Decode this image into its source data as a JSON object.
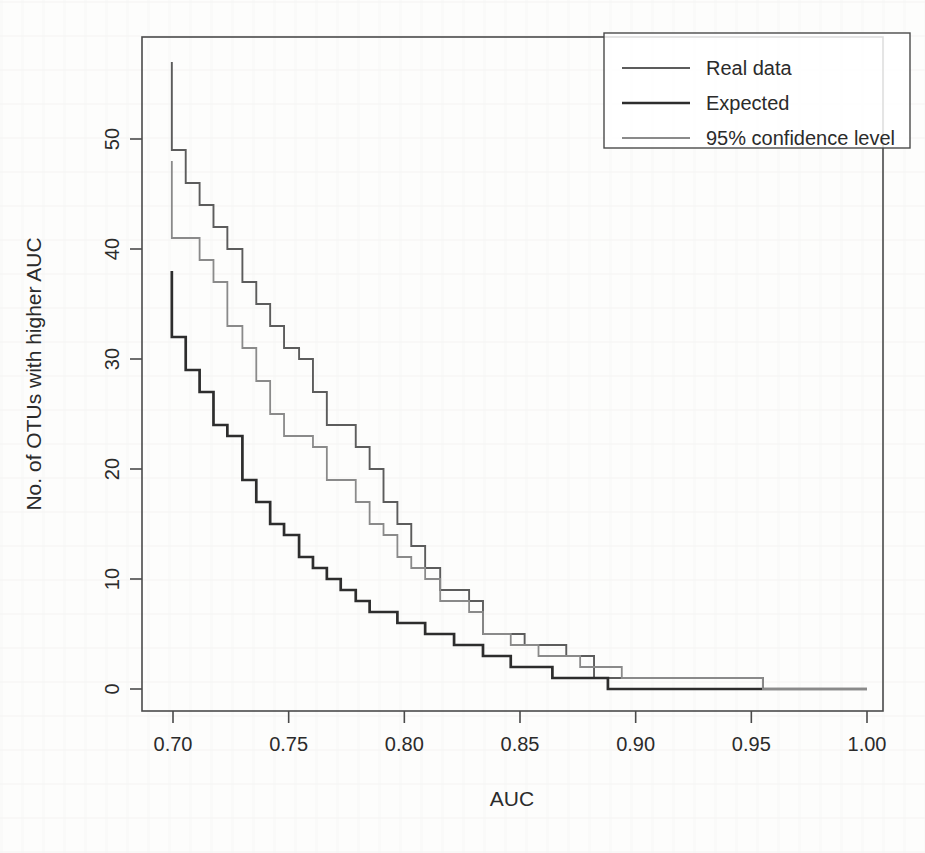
{
  "figure": {
    "background_color": "#fdfdfc",
    "frame_color": "#4a4a4a",
    "text_color": "#2b2b2b"
  },
  "chart_data": {
    "type": "line",
    "subtype": "step",
    "title": "",
    "xlabel": "AUC",
    "ylabel": "No. of OTUs with higher AUC",
    "xlim": [
      0.6855,
      1.0125
    ],
    "ylim": [
      -1.6,
      59.5
    ],
    "xticks": [
      0.7,
      0.75,
      0.8,
      0.85,
      0.9,
      0.95,
      1.0
    ],
    "xtick_labels": [
      "0.70",
      "0.75",
      "0.80",
      "0.85",
      "0.90",
      "0.95",
      "1.00"
    ],
    "yticks": [
      0,
      10,
      20,
      30,
      40,
      50
    ],
    "ytick_labels": [
      "0",
      "10",
      "20",
      "30",
      "40",
      "50"
    ],
    "grid": false,
    "legend_position": "top-right",
    "series": [
      {
        "name": "Real data",
        "color": "#5c5c5c",
        "width": 1.9,
        "points": [
          [
            0.6995,
            57
          ],
          [
            0.6995,
            49
          ],
          [
            0.7055,
            49
          ],
          [
            0.7055,
            46
          ],
          [
            0.7115,
            46
          ],
          [
            0.7115,
            44
          ],
          [
            0.7175,
            44
          ],
          [
            0.7175,
            42
          ],
          [
            0.7235,
            42
          ],
          [
            0.7235,
            40
          ],
          [
            0.73,
            40
          ],
          [
            0.73,
            37
          ],
          [
            0.736,
            37
          ],
          [
            0.736,
            35
          ],
          [
            0.742,
            35
          ],
          [
            0.742,
            33
          ],
          [
            0.748,
            33
          ],
          [
            0.748,
            31
          ],
          [
            0.7545,
            31
          ],
          [
            0.7545,
            30
          ],
          [
            0.7605,
            30
          ],
          [
            0.7605,
            27
          ],
          [
            0.7665,
            27
          ],
          [
            0.7665,
            24
          ],
          [
            0.779,
            24
          ],
          [
            0.779,
            22
          ],
          [
            0.785,
            22
          ],
          [
            0.785,
            20
          ],
          [
            0.791,
            20
          ],
          [
            0.791,
            17
          ],
          [
            0.797,
            17
          ],
          [
            0.797,
            15
          ],
          [
            0.803,
            15
          ],
          [
            0.803,
            13
          ],
          [
            0.809,
            13
          ],
          [
            0.809,
            11
          ],
          [
            0.8155,
            11
          ],
          [
            0.8155,
            9
          ],
          [
            0.828,
            9
          ],
          [
            0.828,
            8
          ],
          [
            0.834,
            8
          ],
          [
            0.834,
            5
          ],
          [
            0.852,
            5
          ],
          [
            0.852,
            4
          ],
          [
            0.87,
            4
          ],
          [
            0.87,
            3
          ],
          [
            0.882,
            3
          ],
          [
            0.882,
            1
          ],
          [
            0.955,
            1
          ],
          [
            0.955,
            0
          ],
          [
            1.0,
            0
          ]
        ]
      },
      {
        "name": "Expected",
        "color": "#2d2d2d",
        "width": 2.7,
        "points": [
          [
            0.6995,
            38
          ],
          [
            0.6995,
            32
          ],
          [
            0.7055,
            32
          ],
          [
            0.7055,
            29
          ],
          [
            0.7115,
            29
          ],
          [
            0.7115,
            27
          ],
          [
            0.7175,
            27
          ],
          [
            0.7175,
            24
          ],
          [
            0.7235,
            24
          ],
          [
            0.7235,
            23
          ],
          [
            0.73,
            23
          ],
          [
            0.73,
            19
          ],
          [
            0.736,
            19
          ],
          [
            0.736,
            17
          ],
          [
            0.742,
            17
          ],
          [
            0.742,
            15
          ],
          [
            0.748,
            15
          ],
          [
            0.748,
            14
          ],
          [
            0.7545,
            14
          ],
          [
            0.7545,
            12
          ],
          [
            0.7605,
            12
          ],
          [
            0.7605,
            11
          ],
          [
            0.7665,
            11
          ],
          [
            0.7665,
            10
          ],
          [
            0.7725,
            10
          ],
          [
            0.7725,
            9
          ],
          [
            0.779,
            9
          ],
          [
            0.779,
            8
          ],
          [
            0.785,
            8
          ],
          [
            0.785,
            7
          ],
          [
            0.797,
            7
          ],
          [
            0.797,
            6
          ],
          [
            0.809,
            6
          ],
          [
            0.809,
            5
          ],
          [
            0.8215,
            5
          ],
          [
            0.8215,
            4
          ],
          [
            0.834,
            4
          ],
          [
            0.834,
            3
          ],
          [
            0.846,
            3
          ],
          [
            0.846,
            2
          ],
          [
            0.864,
            2
          ],
          [
            0.864,
            1
          ],
          [
            0.888,
            1
          ],
          [
            0.888,
            0
          ],
          [
            1.0,
            0
          ]
        ]
      },
      {
        "name": "95% confidence level",
        "color": "#8a8a8a",
        "width": 1.8,
        "points": [
          [
            0.6995,
            48
          ],
          [
            0.6995,
            41
          ],
          [
            0.7115,
            41
          ],
          [
            0.7115,
            39
          ],
          [
            0.7175,
            39
          ],
          [
            0.7175,
            37
          ],
          [
            0.7235,
            37
          ],
          [
            0.7235,
            33
          ],
          [
            0.73,
            33
          ],
          [
            0.73,
            31
          ],
          [
            0.736,
            31
          ],
          [
            0.736,
            28
          ],
          [
            0.742,
            28
          ],
          [
            0.742,
            25
          ],
          [
            0.748,
            25
          ],
          [
            0.748,
            23
          ],
          [
            0.7605,
            23
          ],
          [
            0.7605,
            22
          ],
          [
            0.7665,
            22
          ],
          [
            0.7665,
            19
          ],
          [
            0.779,
            19
          ],
          [
            0.779,
            17
          ],
          [
            0.785,
            17
          ],
          [
            0.785,
            15
          ],
          [
            0.791,
            15
          ],
          [
            0.791,
            14
          ],
          [
            0.797,
            14
          ],
          [
            0.797,
            12
          ],
          [
            0.803,
            12
          ],
          [
            0.803,
            11
          ],
          [
            0.809,
            11
          ],
          [
            0.809,
            10
          ],
          [
            0.8155,
            10
          ],
          [
            0.8155,
            8
          ],
          [
            0.828,
            8
          ],
          [
            0.828,
            7
          ],
          [
            0.834,
            7
          ],
          [
            0.834,
            5
          ],
          [
            0.846,
            5
          ],
          [
            0.846,
            4
          ],
          [
            0.858,
            4
          ],
          [
            0.858,
            3
          ],
          [
            0.876,
            3
          ],
          [
            0.876,
            2
          ],
          [
            0.894,
            2
          ],
          [
            0.894,
            1
          ],
          [
            0.955,
            1
          ],
          [
            0.955,
            0
          ],
          [
            1.0,
            0
          ]
        ]
      }
    ]
  },
  "legend": {
    "entries": [
      {
        "label": "Real data",
        "color": "#5c5c5c",
        "width": 1.9
      },
      {
        "label": "Expected",
        "color": "#2d2d2d",
        "width": 2.7
      },
      {
        "label": "95% confidence level",
        "color": "#8a8a8a",
        "width": 1.8
      }
    ]
  }
}
